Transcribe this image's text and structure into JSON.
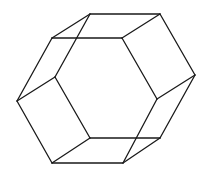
{
  "figure": {
    "title": "",
    "stroke_color": "#1a1a1a",
    "background": "#ffffff",
    "edges": [
      [
        90,
        14,
        160,
        14
      ],
      [
        52,
        38,
        122,
        38
      ],
      [
        52,
        38,
        90,
        14
      ],
      [
        122,
        38,
        160,
        14
      ],
      [
        160,
        14,
        195,
        75
      ],
      [
        122,
        38,
        157,
        99
      ],
      [
        157,
        99,
        195,
        75
      ],
      [
        195,
        75,
        160,
        138
      ],
      [
        157,
        99,
        123,
        163
      ],
      [
        90,
        138,
        160,
        138
      ],
      [
        52,
        163,
        123,
        163
      ],
      [
        90,
        138,
        52,
        163
      ],
      [
        160,
        138,
        123,
        163
      ],
      [
        90,
        138,
        55,
        77
      ],
      [
        55,
        77,
        17,
        101
      ],
      [
        17,
        101,
        52,
        163
      ],
      [
        17,
        101,
        52,
        38
      ],
      [
        55,
        77,
        90,
        14
      ]
    ]
  }
}
